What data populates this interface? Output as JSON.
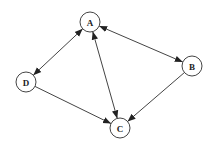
{
  "diagram": {
    "type": "directed-graph",
    "nodes": [
      {
        "id": "A",
        "label": "A",
        "x": 90,
        "y": 22,
        "r": 10
      },
      {
        "id": "B",
        "label": "B",
        "x": 192,
        "y": 66,
        "r": 10
      },
      {
        "id": "C",
        "label": "C",
        "x": 120,
        "y": 128,
        "r": 10
      },
      {
        "id": "D",
        "label": "D",
        "x": 26,
        "y": 82,
        "r": 10
      }
    ],
    "edges": [
      {
        "from": "A",
        "to": "D",
        "bidirectional": true
      },
      {
        "from": "A",
        "to": "B",
        "bidirectional": true
      },
      {
        "from": "A",
        "to": "C",
        "bidirectional": true
      },
      {
        "from": "D",
        "to": "C",
        "bidirectional": false
      },
      {
        "from": "B",
        "to": "C",
        "bidirectional": false
      }
    ],
    "colors": {
      "stroke": "#444444",
      "fill": "#ffffff",
      "text": "#222222"
    }
  }
}
